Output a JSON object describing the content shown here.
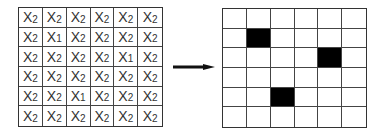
{
  "left_grid": {
    "rows": 6,
    "cols": 6,
    "symbol": "X",
    "cells": [
      [
        "2",
        "2",
        "2",
        "2",
        "2",
        "2"
      ],
      [
        "2",
        "1",
        "2",
        "2",
        "2",
        "2"
      ],
      [
        "2",
        "2",
        "2",
        "2",
        "1",
        "2"
      ],
      [
        "2",
        "2",
        "2",
        "2",
        "2",
        "2"
      ],
      [
        "2",
        "2",
        "1",
        "2",
        "2",
        "2"
      ],
      [
        "2",
        "2",
        "2",
        "2",
        "2",
        "2"
      ]
    ]
  },
  "arrow": {
    "direction": "right",
    "color": "#111111"
  },
  "right_grid": {
    "rows": 6,
    "cols": 6,
    "fill_color": "#000000",
    "filled": [
      [
        1,
        1
      ],
      [
        2,
        4
      ],
      [
        4,
        2
      ]
    ]
  }
}
